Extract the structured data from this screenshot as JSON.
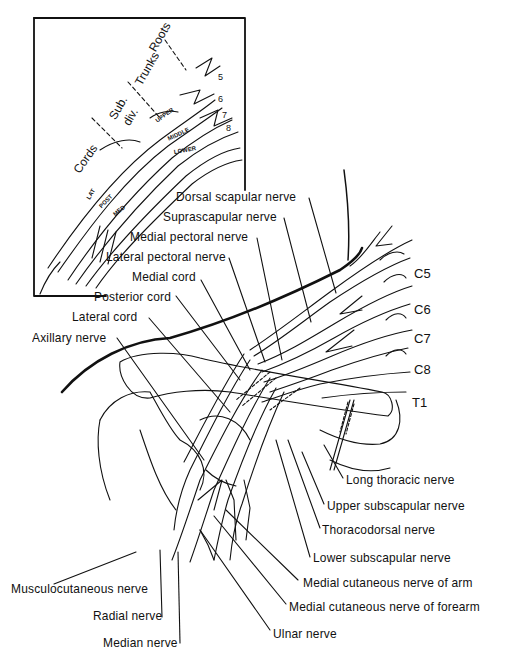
{
  "figure": {
    "inset": {
      "region_labels": [
        "Roots",
        "Trunks",
        "Sub. div.",
        "Cords"
      ],
      "sub_div_line1": "Sub.",
      "sub_div_line2": "div.",
      "trunk_labels": [
        "UPPER",
        "MIDDLE",
        "LOWER"
      ],
      "cord_labels": [
        "LAT",
        "POST",
        "MED"
      ],
      "root_numbers": [
        "5",
        "6",
        "7",
        "8"
      ]
    },
    "roots": [
      "C5",
      "C6",
      "C7",
      "C8",
      "T1"
    ],
    "labels_left": [
      "Dorsal scapular nerve",
      "Suprascapular nerve",
      "Medial pectoral nerve",
      "Lateral pectoral nerve",
      "Medial cord",
      "Posterior cord",
      "Lateral cord",
      "Axillary nerve"
    ],
    "labels_right": [
      "Long thoracic nerve",
      "Upper subscapular nerve",
      "Thoracodorsal nerve",
      "Lower subscapular nerve",
      "Medial cutaneous nerve of arm",
      "Medial cutaneous nerve of forearm",
      "Ulnar nerve"
    ],
    "labels_bottom_left": [
      "Musculocutaneous nerve",
      "Radial nerve",
      "Median nerve"
    ]
  }
}
